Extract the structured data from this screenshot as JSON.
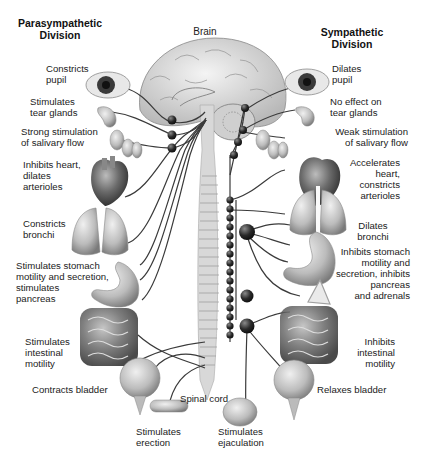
{
  "diagram": {
    "headers": {
      "parasympathetic": "Parasympathetic\nDivision",
      "brain": "Brain",
      "sympathetic": "Sympathetic\nDivision",
      "spinal_cord": "Spinal cord"
    },
    "parasympathetic_effects": [
      {
        "organ": "eye",
        "label": "Constricts\npupil"
      },
      {
        "organ": "tear-glands",
        "label": "Stimulates\ntear glands"
      },
      {
        "organ": "salivary-glands",
        "label": "Strong stimulation\nof salivary flow"
      },
      {
        "organ": "heart",
        "label": "Inhibits heart,\ndilates\narterioles"
      },
      {
        "organ": "lungs",
        "label": "Constricts\nbronchi"
      },
      {
        "organ": "stomach",
        "label": "Stimulates stomach\nmotility and secretion,\nstimulates\npancreas"
      },
      {
        "organ": "intestines",
        "label": "Stimulates\nintestinal\nmotility"
      },
      {
        "organ": "bladder",
        "label": "Contracts bladder"
      },
      {
        "organ": "genitals",
        "label": "Stimulates\nerection"
      }
    ],
    "sympathetic_effects": [
      {
        "organ": "eye",
        "label": "Dilates\npupil"
      },
      {
        "organ": "tear-glands",
        "label": "No effect on\ntear glands"
      },
      {
        "organ": "salivary-glands",
        "label": "Weak stimulation\nof salivary flow"
      },
      {
        "organ": "heart",
        "label": "Accelerates\nheart,\nconstricts\narterioles"
      },
      {
        "organ": "lungs",
        "label": "Dilates\nbronchi"
      },
      {
        "organ": "stomach",
        "label": "Inhibits stomach\nmotility and\nsecretion, inhibits\npancreas\nand adrenals"
      },
      {
        "organ": "intestines",
        "label": "Inhibits\nintestinal\nmotility"
      },
      {
        "organ": "bladder",
        "label": "Relaxes bladder"
      },
      {
        "organ": "genitals",
        "label": "Stimulates\nejaculation"
      }
    ],
    "colors": {
      "nerve": "#3a3a3a",
      "ganglion": "#2e2e2e",
      "spinal_cord": "#d6d6d6",
      "organ": "#bdbdbd",
      "background": "#ffffff"
    }
  }
}
